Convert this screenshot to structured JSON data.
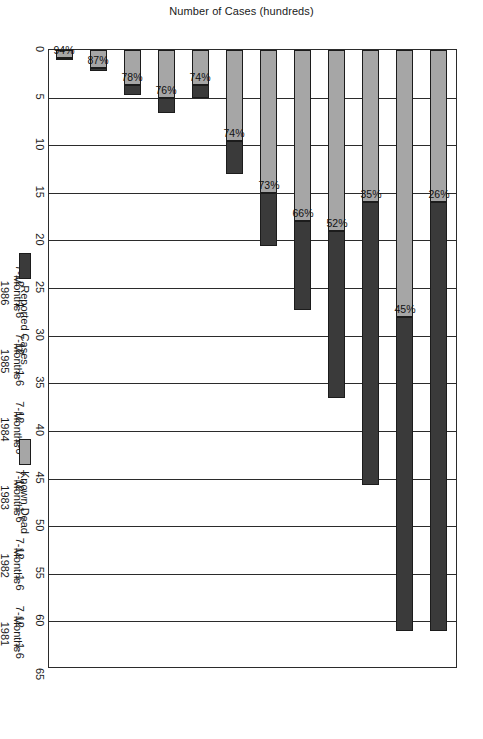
{
  "chart_data": {
    "type": "bar",
    "title": "",
    "subtitle": "",
    "orientation": "horizontal-stacked",
    "xlabel": "",
    "ylabel": "Number of Cases (hundreds)",
    "ylim": [
      0,
      65
    ],
    "yticks": [
      0,
      5,
      10,
      15,
      20,
      25,
      30,
      35,
      40,
      45,
      50,
      55,
      60,
      65
    ],
    "ytick_labels": [
      "0",
      "5",
      "10",
      "15",
      "20",
      "25",
      "30",
      "35",
      "40",
      "45",
      "50",
      "55",
      "60",
      "65"
    ],
    "grid": true,
    "legend_position": "bottom",
    "categories": [
      "1-6 Months 1981",
      "7-12 Months 1981",
      "1-6 Months 1982",
      "7-12 Months 1982",
      "1-6 Months 1983",
      "7-12 Months 1983",
      "1-6 Months 1984",
      "7-12 Months 1984",
      "1-6 Months 1985",
      "7-12 Months 1985",
      "1-6 Months 1986",
      "7-12 Months 1986"
    ],
    "period_labels": [
      "1-6",
      "7-12",
      "1-6",
      "7-12",
      "1-6",
      "7-12",
      "1-6",
      "7-12",
      "1-6",
      "7-12",
      "1-6",
      "7-12"
    ],
    "groups": [
      {
        "label_line1": "Months",
        "label_line2": "1981",
        "span": 2
      },
      {
        "label_line1": "Months",
        "label_line2": "1982",
        "span": 2
      },
      {
        "label_line1": "Months",
        "label_line2": "1983",
        "span": 2
      },
      {
        "label_line1": "Months",
        "label_line2": "1984",
        "span": 2
      },
      {
        "label_line1": "Months",
        "label_line2": "1985",
        "span": 2
      },
      {
        "label_line1": "Months",
        "label_line2": "1986",
        "span": 2
      }
    ],
    "series": [
      {
        "name": "Known Dead",
        "color": "#a6a6a6",
        "values": [
          0.8,
          1.9,
          3.7,
          5.0,
          3.7,
          9.6,
          15.0,
          18.0,
          19.0,
          16.0,
          28.0,
          16.0
        ]
      },
      {
        "name": "Reported Cases",
        "color": "#3a3a3a",
        "values": [
          0.85,
          2.2,
          4.75,
          6.6,
          5.0,
          13.0,
          20.6,
          27.3,
          36.5,
          45.7,
          61.0,
          61.0
        ]
      }
    ],
    "data_labels": [
      "94%",
      "87%",
      "78%",
      "76%",
      "74%",
      "74%",
      "73%",
      "66%",
      "52%",
      "35%",
      "45%",
      "26%"
    ],
    "label_note": "percentages show Known Dead as a share of Reported Cases"
  },
  "legend": {
    "items": [
      {
        "label": "Reported Cases",
        "swatch": "cases"
      },
      {
        "label": "Known Dead",
        "swatch": "dead"
      }
    ]
  }
}
